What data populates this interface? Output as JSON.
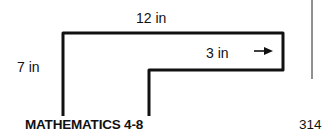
{
  "figure": {
    "labels": {
      "top_width": "12 in",
      "height": "7 in",
      "arm_width": "3 in",
      "arrow": "→"
    },
    "shape": "L-shaped figure outline"
  },
  "footer": {
    "title": "MATHEMATICS 4-8",
    "page_number": "314"
  }
}
